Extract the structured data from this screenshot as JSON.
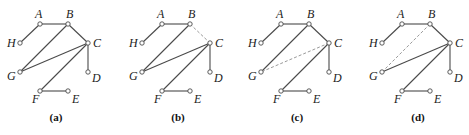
{
  "figure": {
    "panel_offsets": [
      0,
      122,
      241,
      362
    ],
    "nodes": {
      "A": {
        "x": 40,
        "y": 24,
        "lx": -5,
        "ly": -6
      },
      "B": {
        "x": 68,
        "y": 24,
        "lx": -2,
        "ly": -6
      },
      "H": {
        "x": 20,
        "y": 43,
        "lx": -13,
        "ly": 4
      },
      "C": {
        "x": 88,
        "y": 43,
        "lx": 5,
        "ly": 4
      },
      "G": {
        "x": 20,
        "y": 72,
        "lx": -13,
        "ly": 8
      },
      "D": {
        "x": 88,
        "y": 72,
        "lx": 4,
        "ly": 10
      },
      "F": {
        "x": 40,
        "y": 91,
        "lx": -8,
        "ly": 12
      },
      "E": {
        "x": 68,
        "y": 91,
        "lx": 4,
        "ly": 12
      }
    },
    "edges": [
      [
        "H",
        "A"
      ],
      [
        "A",
        "B"
      ],
      [
        "B",
        "C"
      ],
      [
        "B",
        "G"
      ],
      [
        "C",
        "G"
      ],
      [
        "C",
        "D"
      ],
      [
        "C",
        "F"
      ],
      [
        "F",
        "E"
      ]
    ],
    "panels": [
      {
        "label": "(a)",
        "dashed": []
      },
      {
        "label": "(b)",
        "dashed": [
          [
            "B",
            "C"
          ]
        ]
      },
      {
        "label": "(c)",
        "dashed": [
          [
            "C",
            "G"
          ]
        ]
      },
      {
        "label": "(d)",
        "dashed": [
          [
            "B",
            "G"
          ]
        ]
      }
    ],
    "label_y": 121,
    "label_dx": 56
  }
}
